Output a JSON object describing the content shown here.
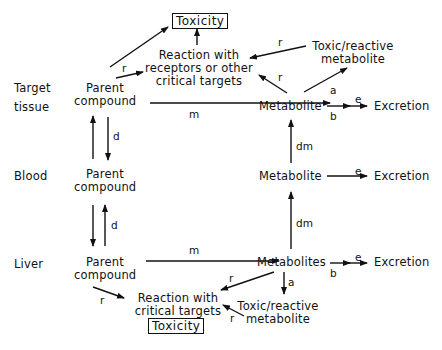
{
  "regions": {
    "target": "Target tissue",
    "target_l1": "Target",
    "target_l2": "tissue",
    "blood": "Blood",
    "liver": "Liver"
  },
  "nodes": {
    "toxicity_top": "Toxicity",
    "reaction_top_l1": "Reaction with",
    "reaction_top_l2": "receptors or other",
    "reaction_top_l3": "critical targets",
    "toxic_top_l1": "Toxic/reactive",
    "toxic_top_l2": "metabolite",
    "parent_target_l1": "Parent",
    "parent_target_l2": "compound",
    "metabolite_target": "Metabolite",
    "excretion_target": "Excretion",
    "parent_blood_l1": "Parent",
    "parent_blood_l2": "compound",
    "metabolite_blood": "Metabolite",
    "excretion_blood": "Excretion",
    "parent_liver_l1": "Parent",
    "parent_liver_l2": "compound",
    "metabolites_liver": "Metabolites",
    "excretion_liver": "Excretion",
    "reaction_bottom_l1": "Reaction with",
    "reaction_bottom_l2": "critical targets",
    "toxic_bottom_l1": "Toxic/reactive",
    "toxic_bottom_l2": "metabolite",
    "toxicity_bottom": "Toxicity"
  },
  "edge_labels": {
    "r": "r",
    "m": "m",
    "d": "d",
    "dm": "dm",
    "a": "a",
    "b": "b",
    "e": "e"
  }
}
